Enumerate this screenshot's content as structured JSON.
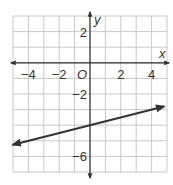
{
  "graph": {
    "x_axis_label": "x",
    "y_axis_label": "y",
    "origin_label": "O",
    "x_tick_labels": [
      {
        "value": -4,
        "label": "−4"
      },
      {
        "value": -2,
        "label": "−2"
      },
      {
        "value": 2,
        "label": "2"
      },
      {
        "value": 4,
        "label": "4"
      }
    ],
    "y_tick_labels": [
      {
        "value": 2,
        "label": "2"
      },
      {
        "value": -2,
        "label": "−2"
      },
      {
        "value": -6,
        "label": "−6"
      }
    ],
    "x_range": [
      -5,
      5
    ],
    "y_range": [
      -7,
      3
    ],
    "grid_color": "#c8c8c8",
    "axis_color": "#333333",
    "line_color": "#333333"
  },
  "chart_data": {
    "type": "line",
    "title": "",
    "xlabel": "x",
    "ylabel": "y",
    "xlim": [
      -5,
      5
    ],
    "ylim": [
      -7,
      3
    ],
    "grid": true,
    "series": [
      {
        "name": "line",
        "equation": "y = (1/4)x - 4",
        "x": [
          -5,
          0,
          4,
          4.8
        ],
        "values": [
          -5.25,
          -4,
          -3,
          -2.8
        ],
        "arrows_both_ends": true
      }
    ]
  }
}
